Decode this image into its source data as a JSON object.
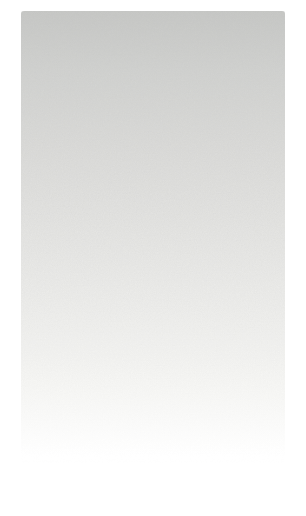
{
  "canvas": {
    "background_color": "#ffffff"
  },
  "scanned_page": {
    "content_text": "",
    "texture": "film-grain",
    "colors": {
      "gradient_top": "#c6c7c5",
      "gradient_upper": "#d1d2d0",
      "gradient_upper_mid": "#dcdcda",
      "gradient_mid": "#e6e6e4",
      "gradient_lower_mid": "#efefed",
      "gradient_lower": "#f7f7f5",
      "gradient_bottom": "#ffffff"
    }
  }
}
